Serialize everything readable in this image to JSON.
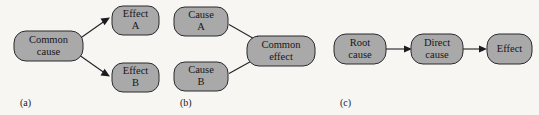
{
  "figure": {
    "background_color": "#f7f6f3",
    "node_fill_color": "#a9a9a9",
    "node_border_color": "#2b2a2e",
    "arrow_color": "#1c1b20",
    "panels": [
      {
        "id": "a",
        "caption": "(a)",
        "nodes": [
          {
            "id": "common-cause",
            "line1": "Common",
            "line2": "cause"
          },
          {
            "id": "effect-a",
            "line1": "Effect",
            "line2": "A"
          },
          {
            "id": "effect-b",
            "line1": "Effect",
            "line2": "B"
          }
        ],
        "edges": [
          {
            "from": "common-cause",
            "to": "effect-a"
          },
          {
            "from": "common-cause",
            "to": "effect-b"
          }
        ]
      },
      {
        "id": "b",
        "caption": "(b)",
        "nodes": [
          {
            "id": "cause-a",
            "line1": "Cause",
            "line2": "A"
          },
          {
            "id": "cause-b",
            "line1": "Cause",
            "line2": "B"
          },
          {
            "id": "common-effect",
            "line1": "Common",
            "line2": "effect"
          }
        ],
        "edges": [
          {
            "from": "cause-a",
            "to": "common-effect"
          },
          {
            "from": "cause-b",
            "to": "common-effect"
          }
        ]
      },
      {
        "id": "c",
        "caption": "(c)",
        "nodes": [
          {
            "id": "root-cause",
            "line1": "Root",
            "line2": "cause"
          },
          {
            "id": "direct-cause",
            "line1": "Direct",
            "line2": "cause"
          },
          {
            "id": "effect",
            "line1": "Effect",
            "line2": ""
          }
        ],
        "edges": [
          {
            "from": "root-cause",
            "to": "direct-cause"
          },
          {
            "from": "direct-cause",
            "to": "effect"
          }
        ]
      }
    ]
  }
}
